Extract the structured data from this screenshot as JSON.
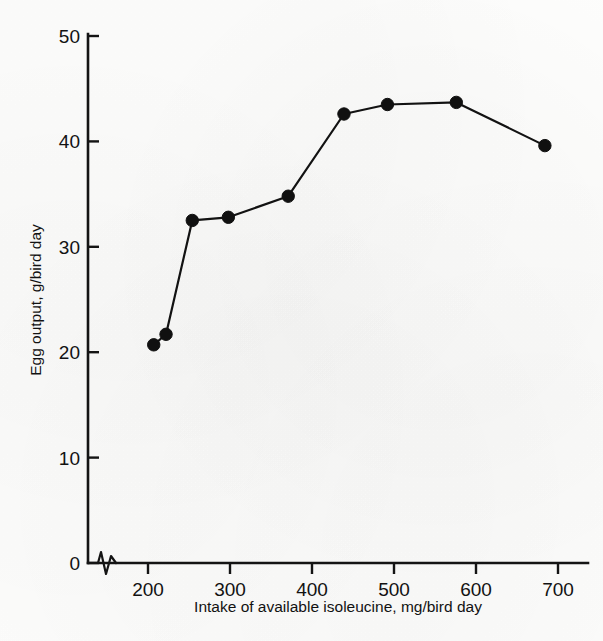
{
  "figure": {
    "background_color": "#fdfdfc",
    "ink_color": "#121212"
  },
  "chart_data": {
    "type": "line",
    "title": "",
    "subtitle": "",
    "xlabel": "Intake of available isoleucine, mg/bird day",
    "ylabel": "Egg output, g/bird day",
    "xlim": [
      150,
      720
    ],
    "ylim": [
      0,
      50
    ],
    "xticks": [
      200,
      300,
      400,
      500,
      600,
      700
    ],
    "xtick_labels": [
      "200",
      "300",
      "400",
      "500",
      "600",
      "700"
    ],
    "yticks": [
      0,
      10,
      20,
      30,
      40,
      50
    ],
    "ytick_labels": [
      "0",
      "10",
      "20",
      "30",
      "40",
      "50"
    ],
    "grid": false,
    "legend": false,
    "legend_position": "none",
    "axis_break": {
      "axis": "x",
      "present": true,
      "note": "zig-zag break between origin and first tick"
    },
    "marker": "filled-circle",
    "series": [
      {
        "name": "Egg output",
        "x": [
          207,
          222,
          254,
          298,
          371,
          439,
          492,
          576,
          684
        ],
        "y": [
          20.7,
          21.7,
          32.5,
          32.8,
          34.8,
          42.6,
          43.5,
          43.7,
          39.6
        ]
      }
    ]
  },
  "labels": {
    "x_axis_title": "Intake of available isoleucine, mg/bird day",
    "y_axis_title": "Egg output, g/bird day"
  }
}
